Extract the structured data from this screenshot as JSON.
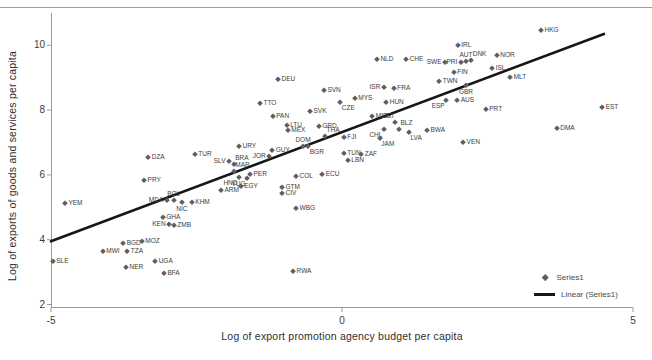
{
  "chart_data": {
    "type": "scatter",
    "title": "",
    "xlabel": "Log of export promotion agency budget per capita",
    "ylabel": "Log of exports of goods and services per capita",
    "xlim": [
      -5,
      5
    ],
    "ylim": [
      2,
      11
    ],
    "xticks": [
      -5,
      0,
      5
    ],
    "yticks": [
      2,
      4,
      6,
      8,
      10
    ],
    "grid": false,
    "legend_position": "bottom-right-inside",
    "legend_series_label": "Series1",
    "legend_linear_label": "Linear (Series1)",
    "trendline": {
      "x1": -5.0,
      "y1": 3.95,
      "x2": 4.5,
      "y2": 10.35
    },
    "points": [
      {
        "label": "SLE",
        "x": -4.97,
        "y": 3.34,
        "lp": "r"
      },
      {
        "label": "YEM",
        "x": -4.76,
        "y": 5.13,
        "lp": "r"
      },
      {
        "label": "MWI",
        "x": -4.11,
        "y": 3.65,
        "lp": "r"
      },
      {
        "label": "BGD",
        "x": -3.76,
        "y": 3.9,
        "lp": "r"
      },
      {
        "label": "TZA",
        "x": -3.69,
        "y": 3.65,
        "lp": "r"
      },
      {
        "label": "NER",
        "x": -3.71,
        "y": 3.16,
        "lp": "r"
      },
      {
        "label": "MOZ",
        "x": -3.44,
        "y": 3.96,
        "lp": "r"
      },
      {
        "label": "UGA",
        "x": -3.21,
        "y": 3.34,
        "lp": "r"
      },
      {
        "label": "BFA",
        "x": -3.06,
        "y": 2.97,
        "lp": "r"
      },
      {
        "label": "PRY",
        "x": -3.4,
        "y": 5.84,
        "lp": "r"
      },
      {
        "label": "DZA",
        "x": -3.33,
        "y": 6.55,
        "lp": "r"
      },
      {
        "label": "GHA",
        "x": -3.08,
        "y": 4.7,
        "lp": "r"
      },
      {
        "label": "KEN",
        "x": -2.97,
        "y": 4.48,
        "lp": "l"
      },
      {
        "label": "ZMB",
        "x": -2.89,
        "y": 4.45,
        "lp": "r"
      },
      {
        "label": "MDA",
        "x": -3.01,
        "y": 5.23,
        "lp": "l"
      },
      {
        "label": "BOL",
        "x": -2.89,
        "y": 5.23,
        "lp": "a"
      },
      {
        "label": "NIC",
        "x": -2.75,
        "y": 5.16,
        "lp": "b"
      },
      {
        "label": "KHM",
        "x": -2.58,
        "y": 5.16,
        "lp": "r"
      },
      {
        "label": "TUR",
        "x": -2.53,
        "y": 6.65,
        "lp": "r"
      },
      {
        "label": "URY",
        "x": -1.77,
        "y": 6.89,
        "lp": "r"
      },
      {
        "label": "SLV",
        "x": -1.94,
        "y": 6.43,
        "lp": "l"
      },
      {
        "label": "BRA",
        "x": -1.86,
        "y": 6.34,
        "lp": "ar"
      },
      {
        "label": "MAR",
        "x": -1.86,
        "y": 6.12,
        "lp": "ar"
      },
      {
        "label": "HND",
        "x": -1.77,
        "y": 5.94,
        "lp": "bl"
      },
      {
        "label": "PER",
        "x": -1.58,
        "y": 6.03,
        "lp": "r"
      },
      {
        "label": "YUG",
        "x": -1.63,
        "y": 5.9,
        "lp": "bl"
      },
      {
        "label": "EGY",
        "x": -1.74,
        "y": 5.66,
        "lp": "r"
      },
      {
        "label": "ARM",
        "x": -2.08,
        "y": 5.53,
        "lp": "r"
      },
      {
        "label": "GTM",
        "x": -1.03,
        "y": 5.63,
        "lp": "r"
      },
      {
        "label": "CIV",
        "x": -1.03,
        "y": 5.44,
        "lp": "r"
      },
      {
        "label": "WBG",
        "x": -0.79,
        "y": 4.98,
        "lp": "r"
      },
      {
        "label": "RWA",
        "x": -0.84,
        "y": 3.03,
        "lp": "r"
      },
      {
        "label": "COL",
        "x": -0.79,
        "y": 5.97,
        "lp": "r"
      },
      {
        "label": "ECU",
        "x": -0.34,
        "y": 6.03,
        "lp": "r"
      },
      {
        "label": "JOR",
        "x": -1.25,
        "y": 6.58,
        "lp": "l"
      },
      {
        "label": "GUY",
        "x": -1.2,
        "y": 6.77,
        "lp": "r"
      },
      {
        "label": "DOM",
        "x": -0.67,
        "y": 6.89,
        "lp": "a"
      },
      {
        "label": "BGR",
        "x": -0.58,
        "y": 6.89,
        "lp": "br"
      },
      {
        "label": "TTO",
        "x": -1.41,
        "y": 8.22,
        "lp": "r"
      },
      {
        "label": "PAN",
        "x": -1.19,
        "y": 7.82,
        "lp": "r"
      },
      {
        "label": "DEU",
        "x": -1.1,
        "y": 8.96,
        "lp": "r"
      },
      {
        "label": "LTU",
        "x": -0.95,
        "y": 7.54,
        "lp": "r"
      },
      {
        "label": "MEX",
        "x": -0.93,
        "y": 7.39,
        "lp": "r"
      },
      {
        "label": "GRD",
        "x": -0.4,
        "y": 7.51,
        "lp": "r"
      },
      {
        "label": "THA",
        "x": -0.29,
        "y": 7.2,
        "lp": "ar"
      },
      {
        "label": "FJI",
        "x": 0.03,
        "y": 7.17,
        "lp": "r"
      },
      {
        "label": "TUN",
        "x": 0.03,
        "y": 6.68,
        "lp": "r"
      },
      {
        "label": "ZAF",
        "x": 0.33,
        "y": 6.65,
        "lp": "r"
      },
      {
        "label": "LBN",
        "x": 0.1,
        "y": 6.46,
        "lp": "r"
      },
      {
        "label": "SVK",
        "x": -0.55,
        "y": 7.97,
        "lp": "r"
      },
      {
        "label": "SVN",
        "x": -0.31,
        "y": 8.62,
        "lp": "r"
      },
      {
        "label": "CZE",
        "x": -0.03,
        "y": 8.25,
        "lp": "br"
      },
      {
        "label": "MYS",
        "x": 0.22,
        "y": 8.37,
        "lp": "r"
      },
      {
        "label": "ISR",
        "x": 0.72,
        "y": 8.71,
        "lp": "l"
      },
      {
        "label": "FRA",
        "x": 0.89,
        "y": 8.68,
        "lp": "r"
      },
      {
        "label": "HUN",
        "x": 0.76,
        "y": 8.25,
        "lp": "r"
      },
      {
        "label": "MUS",
        "x": 0.52,
        "y": 7.82,
        "lp": "r"
      },
      {
        "label": "CRI",
        "x": 0.91,
        "y": 7.63,
        "lp": "al"
      },
      {
        "label": "CHL",
        "x": 0.72,
        "y": 7.42,
        "lp": "bl"
      },
      {
        "label": "JAM",
        "x": 0.65,
        "y": 7.14,
        "lp": "br"
      },
      {
        "label": "BLZ",
        "x": 0.98,
        "y": 7.42,
        "lp": "ar"
      },
      {
        "label": "LVA",
        "x": 1.15,
        "y": 7.32,
        "lp": "br"
      },
      {
        "label": "BWA",
        "x": 1.46,
        "y": 7.39,
        "lp": "r"
      },
      {
        "label": "NLD",
        "x": 0.6,
        "y": 9.58,
        "lp": "r"
      },
      {
        "label": "CHE",
        "x": 1.1,
        "y": 9.58,
        "lp": "r"
      },
      {
        "label": "SWE",
        "x": 1.77,
        "y": 9.49,
        "lp": "l"
      },
      {
        "label": "PRI",
        "x": 2.04,
        "y": 9.49,
        "lp": "l"
      },
      {
        "label": "AUT",
        "x": 2.13,
        "y": 9.52,
        "lp": "a"
      },
      {
        "label": "DNK",
        "x": 2.22,
        "y": 9.55,
        "lp": "ar"
      },
      {
        "label": "NOR",
        "x": 2.66,
        "y": 9.7,
        "lp": "r"
      },
      {
        "label": "IRL",
        "x": 1.99,
        "y": 10.01,
        "lp": "r"
      },
      {
        "label": "HKG",
        "x": 3.42,
        "y": 10.47,
        "lp": "r"
      },
      {
        "label": "ISL",
        "x": 2.58,
        "y": 9.3,
        "lp": "r"
      },
      {
        "label": "FIN",
        "x": 1.92,
        "y": 9.18,
        "lp": "r"
      },
      {
        "label": "TWN",
        "x": 1.67,
        "y": 8.9,
        "lp": "r"
      },
      {
        "label": "GBR",
        "x": 2.13,
        "y": 8.77,
        "lp": "b"
      },
      {
        "label": "MLT",
        "x": 2.89,
        "y": 9.02,
        "lp": "r"
      },
      {
        "label": "ESP",
        "x": 1.79,
        "y": 8.31,
        "lp": "bl"
      },
      {
        "label": "AUS",
        "x": 1.98,
        "y": 8.31,
        "lp": "r"
      },
      {
        "label": "PRT",
        "x": 2.47,
        "y": 8.03,
        "lp": "r"
      },
      {
        "label": "VEN",
        "x": 2.08,
        "y": 7.02,
        "lp": "r"
      },
      {
        "label": "DMA",
        "x": 3.69,
        "y": 7.45,
        "lp": "r"
      },
      {
        "label": "EST",
        "x": 4.47,
        "y": 8.1,
        "lp": "r"
      }
    ]
  },
  "colors": {
    "marker": "#5f5f5f",
    "point_label": "#3c3c3c",
    "trendline": "#161616",
    "axis": "#9a9a9a",
    "tick_text": "#3c3c3c",
    "top_rule": "#9e9e9e"
  }
}
